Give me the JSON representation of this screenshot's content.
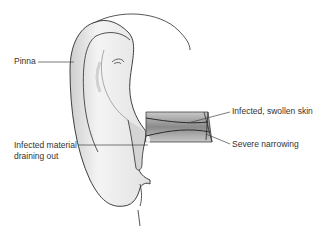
{
  "diagram": {
    "labels": {
      "pinna": "Pinna",
      "infected_material_line1": "Infected material",
      "infected_material_line2": "draining out",
      "swollen_skin": "Infected, swollen skin",
      "narrowing": "Severe narrowing"
    },
    "colors": {
      "outline": "#2b2b2b",
      "skin_light": "#f2f2f2",
      "skin_mid": "#d9d9d9",
      "skin_shadow": "#b5b5b5",
      "canal_dark": "#6f6f6f",
      "leader_line": "#444444",
      "text": "#333333"
    }
  }
}
